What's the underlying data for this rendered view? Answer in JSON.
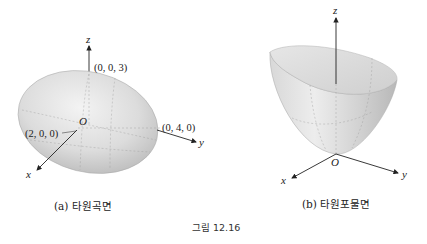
{
  "figure": {
    "number_label": "그림 12.16",
    "panels": [
      {
        "id": "a",
        "caption": "(a) 타원곡면",
        "surface": "ellipsoid",
        "axes": [
          "x",
          "y",
          "z"
        ],
        "origin_label": "O",
        "point_labels": [
          "(0, 0, 3)",
          "(0, 4, 0)",
          "(2, 0, 0)"
        ]
      },
      {
        "id": "b",
        "caption": "(b) 타원포물면",
        "surface": "elliptic-paraboloid",
        "axes": [
          "x",
          "y",
          "z"
        ],
        "origin_label": "O"
      }
    ]
  }
}
